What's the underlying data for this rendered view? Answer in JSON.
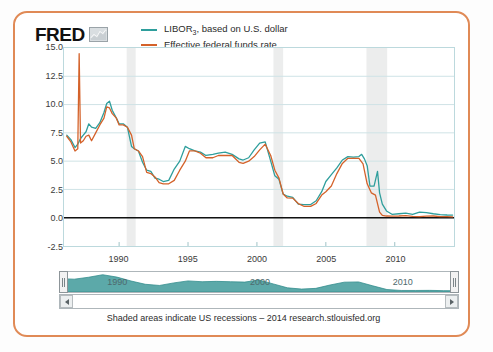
{
  "brand": {
    "name": "FRED",
    "mark_icon": "chart-thumbnail-icon"
  },
  "legend": {
    "position": "top-left",
    "items": [
      {
        "label_main": "LIBOR",
        "label_sub": "3",
        "label_rest": ", based on U.S. dollar",
        "color": "#2e9e9c"
      },
      {
        "label_main": "Effective federal funds rate",
        "label_sub": "",
        "label_rest": "",
        "color": "#d4622a"
      }
    ]
  },
  "footnote": "Shaded areas indicate US recessions – 2014 research.stlouisfed.org",
  "navigator": {
    "labels": [
      "1990",
      "2000",
      "2010"
    ],
    "left_handle_icon": "drag-handle-icon",
    "right_handle_icon": "drag-handle-icon",
    "scroll_left_icon": "triangle-left-icon",
    "scroll_right_icon": "triangle-right-icon",
    "fill_color": "#3f9a9a"
  },
  "chart_data": {
    "type": "line",
    "title": "",
    "xlabel": "",
    "ylabel": "",
    "xlim": [
      1986.0,
      2014.3
    ],
    "ylim": [
      -2.5,
      15.0
    ],
    "yticks": [
      15.0,
      12.5,
      10.0,
      7.5,
      5.0,
      2.5,
      0.0,
      -2.5
    ],
    "ytick_labels": [
      "15.0",
      "12.5",
      "10.0",
      "7.5",
      "5.0",
      "2.5",
      "0.0",
      "-2.5"
    ],
    "xticks": [
      1990,
      1995,
      2000,
      2005,
      2010
    ],
    "xtick_labels": [
      "1990",
      "1995",
      "2000",
      "2005",
      "2010"
    ],
    "grid": true,
    "zero_line": 0.0,
    "recessions": [
      {
        "start": 1990.55,
        "end": 1991.2
      },
      {
        "start": 2001.2,
        "end": 2001.9
      },
      {
        "start": 2007.95,
        "end": 2009.45
      }
    ],
    "series": [
      {
        "name": "LIBOR3, based on U.S. dollar",
        "color": "#2e9e9c",
        "x": [
          1986.2,
          1986.5,
          1986.8,
          1987.0,
          1987.2,
          1987.4,
          1987.6,
          1987.8,
          1988.0,
          1988.3,
          1988.6,
          1988.9,
          1989.1,
          1989.3,
          1989.5,
          1989.8,
          1990.0,
          1990.3,
          1990.6,
          1990.9,
          1991.1,
          1991.4,
          1991.7,
          1992.0,
          1992.3,
          1992.6,
          1992.9,
          1993.2,
          1993.6,
          1994.0,
          1994.4,
          1994.8,
          1995.1,
          1995.5,
          1995.9,
          1996.3,
          1996.8,
          1997.2,
          1997.7,
          1998.2,
          1998.7,
          1999.0,
          1999.4,
          1999.8,
          2000.2,
          2000.6,
          2001.0,
          2001.3,
          2001.6,
          2001.9,
          2002.2,
          2002.6,
          2003.0,
          2003.4,
          2003.9,
          2004.3,
          2004.7,
          2005.0,
          2005.4,
          2005.8,
          2006.2,
          2006.6,
          2007.0,
          2007.4,
          2007.6,
          2007.8,
          2008.0,
          2008.2,
          2008.5,
          2008.75,
          2008.9,
          2009.1,
          2009.4,
          2009.8,
          2010.3,
          2010.8,
          2011.3,
          2011.8,
          2012.3,
          2012.8,
          2013.3,
          2013.8,
          2014.2
        ],
        "y": [
          7.3,
          6.9,
          6.2,
          6.5,
          7.0,
          7.3,
          7.6,
          8.3,
          8.0,
          7.9,
          8.4,
          9.3,
          10.1,
          10.3,
          9.5,
          8.8,
          8.3,
          8.3,
          8.0,
          6.3,
          6.1,
          5.9,
          4.9,
          4.2,
          4.1,
          3.5,
          3.4,
          3.2,
          3.3,
          4.3,
          5.0,
          6.3,
          6.1,
          5.9,
          5.8,
          5.5,
          5.6,
          5.7,
          5.8,
          5.6,
          5.2,
          5.1,
          5.3,
          6.0,
          6.6,
          6.7,
          5.0,
          3.7,
          3.4,
          2.1,
          1.9,
          1.8,
          1.2,
          1.15,
          1.16,
          1.5,
          2.3,
          3.2,
          3.8,
          4.4,
          5.1,
          5.4,
          5.35,
          5.4,
          5.6,
          5.2,
          4.6,
          2.8,
          2.8,
          4.1,
          2.2,
          1.2,
          0.6,
          0.3,
          0.35,
          0.4,
          0.3,
          0.5,
          0.45,
          0.35,
          0.27,
          0.24,
          0.23
        ]
      },
      {
        "name": "Effective federal funds rate",
        "color": "#d4622a",
        "x": [
          1986.2,
          1986.5,
          1986.8,
          1987.0,
          1987.1,
          1987.2,
          1987.4,
          1987.6,
          1987.8,
          1988.0,
          1988.3,
          1988.6,
          1988.9,
          1989.1,
          1989.3,
          1989.5,
          1989.8,
          1990.0,
          1990.3,
          1990.6,
          1990.9,
          1991.1,
          1991.4,
          1991.7,
          1992.0,
          1992.3,
          1992.6,
          1992.9,
          1993.2,
          1993.6,
          1994.0,
          1994.4,
          1994.8,
          1995.1,
          1995.5,
          1995.9,
          1996.3,
          1996.8,
          1997.2,
          1997.7,
          1998.2,
          1998.7,
          1999.0,
          1999.4,
          1999.8,
          2000.2,
          2000.6,
          2001.0,
          2001.3,
          2001.6,
          2001.9,
          2002.2,
          2002.6,
          2003.0,
          2003.4,
          2003.9,
          2004.3,
          2004.7,
          2005.0,
          2005.4,
          2005.8,
          2006.2,
          2006.6,
          2007.0,
          2007.4,
          2007.7,
          2008.0,
          2008.3,
          2008.6,
          2008.9,
          2009.1,
          2009.4,
          2009.8,
          2010.3,
          2010.8,
          2011.3,
          2011.8,
          2012.3,
          2012.8,
          2013.3,
          2013.8,
          2014.2
        ],
        "y": [
          7.2,
          6.7,
          5.9,
          6.1,
          14.5,
          6.6,
          6.8,
          7.2,
          7.3,
          6.8,
          7.5,
          8.2,
          8.8,
          9.8,
          9.7,
          9.2,
          8.8,
          8.2,
          8.2,
          8.0,
          7.3,
          6.1,
          5.9,
          5.4,
          4.0,
          3.9,
          3.6,
          3.1,
          3.0,
          3.0,
          3.3,
          4.2,
          5.0,
          5.9,
          5.9,
          5.7,
          5.3,
          5.3,
          5.5,
          5.5,
          5.5,
          4.9,
          4.8,
          5.0,
          5.4,
          6.0,
          6.5,
          5.5,
          4.2,
          3.5,
          2.1,
          1.75,
          1.73,
          1.25,
          1.01,
          1.0,
          1.26,
          2.0,
          2.3,
          2.8,
          3.9,
          4.8,
          5.25,
          5.25,
          5.25,
          4.75,
          3.0,
          2.2,
          2.0,
          0.5,
          0.2,
          0.15,
          0.14,
          0.15,
          0.18,
          0.12,
          0.09,
          0.14,
          0.15,
          0.1,
          0.09,
          0.08
        ]
      }
    ],
    "navigator_series": {
      "name": "LIBOR3 overview",
      "x": [
        1986,
        1987,
        1988,
        1989,
        1990,
        1991,
        1992,
        1993,
        1994,
        1995,
        1996,
        1997,
        1998,
        1999,
        2000,
        2001,
        2002,
        2003,
        2004,
        2005,
        2006,
        2007,
        2008,
        2009,
        2010,
        2011,
        2012,
        2013,
        2014
      ],
      "y": [
        7.3,
        7.0,
        8.1,
        9.6,
        8.2,
        5.9,
        4.0,
        3.3,
        4.8,
        6.0,
        5.5,
        5.7,
        5.5,
        5.3,
        6.5,
        4.2,
        1.9,
        1.2,
        1.6,
        3.6,
        5.2,
        5.4,
        3.1,
        0.9,
        0.4,
        0.35,
        0.45,
        0.27,
        0.23
      ]
    }
  }
}
